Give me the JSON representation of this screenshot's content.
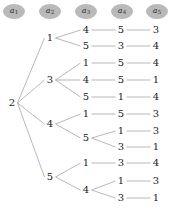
{
  "figure": {
    "type": "tree-diagram",
    "edge_color": "#9a9a9a",
    "node_text_color": "#222222",
    "header_fill": "#b9b9b9",
    "background": "#ffffff"
  },
  "header": {
    "columns": [
      {
        "name": "a1",
        "base": "a",
        "sub": "1",
        "cx": 14,
        "cy": 11
      },
      {
        "name": "a2",
        "base": "a",
        "sub": "2",
        "cx": 50,
        "cy": 11
      },
      {
        "name": "a3",
        "base": "a",
        "sub": "3",
        "cx": 86,
        "cy": 11
      },
      {
        "name": "a4",
        "base": "a",
        "sub": "4",
        "cx": 122,
        "cy": 11
      },
      {
        "name": "a5",
        "base": "a",
        "sub": "5",
        "cx": 157,
        "cy": 11
      }
    ]
  },
  "columns_x": [
    12,
    50,
    86,
    121,
    156
  ],
  "tree": {
    "root": {
      "label": "2",
      "x": 12,
      "y": 103
    },
    "nodes": [
      {
        "id": "n0",
        "label": "2",
        "col": 0,
        "x": 12,
        "y": 103
      },
      {
        "id": "n1",
        "label": "1",
        "col": 1,
        "x": 50,
        "y": 38
      },
      {
        "id": "n2",
        "label": "3",
        "col": 1,
        "x": 50,
        "y": 80
      },
      {
        "id": "n3",
        "label": "4",
        "col": 1,
        "x": 50,
        "y": 124
      },
      {
        "id": "n4",
        "label": "5",
        "col": 1,
        "x": 50,
        "y": 177
      },
      {
        "id": "n5",
        "label": "4",
        "col": 2,
        "x": 86,
        "y": 30
      },
      {
        "id": "n6",
        "label": "5",
        "col": 2,
        "x": 86,
        "y": 46
      },
      {
        "id": "n7",
        "label": "1",
        "col": 2,
        "x": 86,
        "y": 63
      },
      {
        "id": "n8",
        "label": "4",
        "col": 2,
        "x": 86,
        "y": 80
      },
      {
        "id": "n9",
        "label": "5",
        "col": 2,
        "x": 86,
        "y": 97
      },
      {
        "id": "n10",
        "label": "1",
        "col": 2,
        "x": 86,
        "y": 114
      },
      {
        "id": "n11",
        "label": "5",
        "col": 2,
        "x": 86,
        "y": 138
      },
      {
        "id": "n12",
        "label": "1",
        "col": 2,
        "x": 86,
        "y": 163
      },
      {
        "id": "n13",
        "label": "4",
        "col": 2,
        "x": 86,
        "y": 190
      },
      {
        "id": "n14",
        "label": "5",
        "col": 3,
        "x": 121,
        "y": 30
      },
      {
        "id": "n15",
        "label": "3",
        "col": 3,
        "x": 121,
        "y": 46
      },
      {
        "id": "n16",
        "label": "5",
        "col": 3,
        "x": 121,
        "y": 63
      },
      {
        "id": "n17",
        "label": "5",
        "col": 3,
        "x": 121,
        "y": 80
      },
      {
        "id": "n18",
        "label": "1",
        "col": 3,
        "x": 121,
        "y": 97
      },
      {
        "id": "n19",
        "label": "5",
        "col": 3,
        "x": 121,
        "y": 114
      },
      {
        "id": "n20",
        "label": "1",
        "col": 3,
        "x": 121,
        "y": 131
      },
      {
        "id": "n21",
        "label": "3",
        "col": 3,
        "x": 121,
        "y": 147
      },
      {
        "id": "n22",
        "label": "3",
        "col": 3,
        "x": 121,
        "y": 163
      },
      {
        "id": "n23",
        "label": "1",
        "col": 3,
        "x": 121,
        "y": 181
      },
      {
        "id": "n24",
        "label": "3",
        "col": 3,
        "x": 121,
        "y": 198
      },
      {
        "id": "n25",
        "label": "3",
        "col": 4,
        "x": 156,
        "y": 30
      },
      {
        "id": "n26",
        "label": "4",
        "col": 4,
        "x": 156,
        "y": 46
      },
      {
        "id": "n27",
        "label": "4",
        "col": 4,
        "x": 156,
        "y": 63
      },
      {
        "id": "n28",
        "label": "1",
        "col": 4,
        "x": 156,
        "y": 80
      },
      {
        "id": "n29",
        "label": "4",
        "col": 4,
        "x": 156,
        "y": 97
      },
      {
        "id": "n30",
        "label": "3",
        "col": 4,
        "x": 156,
        "y": 114
      },
      {
        "id": "n31",
        "label": "3",
        "col": 4,
        "x": 156,
        "y": 131
      },
      {
        "id": "n32",
        "label": "1",
        "col": 4,
        "x": 156,
        "y": 147
      },
      {
        "id": "n33",
        "label": "4",
        "col": 4,
        "x": 156,
        "y": 163
      },
      {
        "id": "n34",
        "label": "3",
        "col": 4,
        "x": 156,
        "y": 181
      },
      {
        "id": "n35",
        "label": "1",
        "col": 4,
        "x": 156,
        "y": 198
      }
    ],
    "edges": [
      {
        "from": "n0",
        "to": "n1"
      },
      {
        "from": "n0",
        "to": "n2"
      },
      {
        "from": "n0",
        "to": "n3"
      },
      {
        "from": "n0",
        "to": "n4"
      },
      {
        "from": "n1",
        "to": "n5"
      },
      {
        "from": "n1",
        "to": "n6"
      },
      {
        "from": "n2",
        "to": "n7"
      },
      {
        "from": "n2",
        "to": "n8"
      },
      {
        "from": "n2",
        "to": "n9"
      },
      {
        "from": "n3",
        "to": "n10"
      },
      {
        "from": "n3",
        "to": "n11"
      },
      {
        "from": "n4",
        "to": "n12"
      },
      {
        "from": "n4",
        "to": "n13"
      },
      {
        "from": "n5",
        "to": "n14"
      },
      {
        "from": "n6",
        "to": "n15"
      },
      {
        "from": "n7",
        "to": "n16"
      },
      {
        "from": "n8",
        "to": "n17"
      },
      {
        "from": "n9",
        "to": "n18"
      },
      {
        "from": "n10",
        "to": "n19"
      },
      {
        "from": "n11",
        "to": "n20"
      },
      {
        "from": "n11",
        "to": "n21"
      },
      {
        "from": "n12",
        "to": "n22"
      },
      {
        "from": "n13",
        "to": "n23"
      },
      {
        "from": "n13",
        "to": "n24"
      },
      {
        "from": "n14",
        "to": "n25"
      },
      {
        "from": "n15",
        "to": "n26"
      },
      {
        "from": "n16",
        "to": "n27"
      },
      {
        "from": "n17",
        "to": "n28"
      },
      {
        "from": "n18",
        "to": "n29"
      },
      {
        "from": "n19",
        "to": "n30"
      },
      {
        "from": "n20",
        "to": "n31"
      },
      {
        "from": "n21",
        "to": "n32"
      },
      {
        "from": "n22",
        "to": "n33"
      },
      {
        "from": "n23",
        "to": "n34"
      },
      {
        "from": "n24",
        "to": "n35"
      }
    ],
    "paths": [
      [
        "2",
        "1",
        "4",
        "5",
        "3"
      ],
      [
        "2",
        "1",
        "5",
        "3",
        "4"
      ],
      [
        "2",
        "3",
        "1",
        "5",
        "4"
      ],
      [
        "2",
        "3",
        "4",
        "5",
        "1"
      ],
      [
        "2",
        "3",
        "5",
        "1",
        "4"
      ],
      [
        "2",
        "4",
        "1",
        "5",
        "3"
      ],
      [
        "2",
        "4",
        "5",
        "1",
        "3"
      ],
      [
        "2",
        "4",
        "5",
        "3",
        "1"
      ],
      [
        "2",
        "5",
        "1",
        "3",
        "4"
      ],
      [
        "2",
        "5",
        "4",
        "1",
        "3"
      ],
      [
        "2",
        "5",
        "4",
        "3",
        "1"
      ]
    ]
  }
}
